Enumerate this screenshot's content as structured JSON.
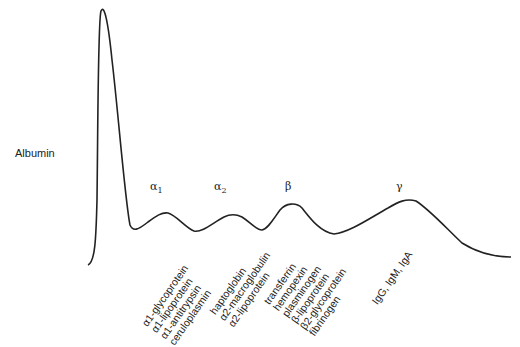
{
  "diagram": {
    "type": "serum protein electrophoresis",
    "albumin_label": "Albumin",
    "fractions": [
      {
        "symbol": "α",
        "sub": "1",
        "proteins": [
          "α1-glycoprotein",
          "α1-lipoprotein",
          "α1-antitrypsin",
          "ceruloplasmin"
        ]
      },
      {
        "symbol": "α",
        "sub": "2",
        "proteins": [
          "haptoglobin",
          "α2-macroglobulin",
          "α2-lipoprotein"
        ]
      },
      {
        "symbol": "β",
        "sub": "",
        "proteins": [
          "transferrin",
          "hemopexin",
          "plasminogen",
          "β-lipoprotein",
          "β2-glycoprotein",
          "fibrinogen"
        ]
      },
      {
        "symbol": "γ",
        "sub": "",
        "proteins": [
          "IgG, IgM, IgA"
        ]
      }
    ],
    "line_color": "#222222"
  }
}
